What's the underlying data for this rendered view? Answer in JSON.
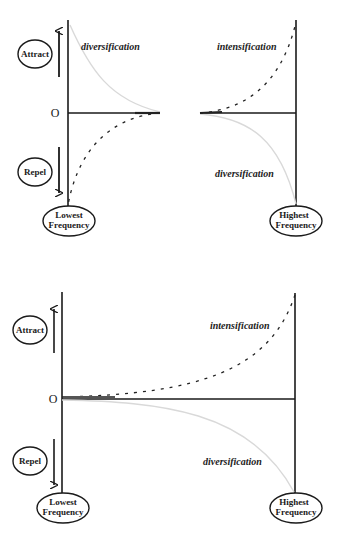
{
  "colors": {
    "axis": "#1a1a1a",
    "curve_light": "#d9d9d9",
    "curve_dark": "#222222",
    "background": "#ffffff"
  },
  "panels": [
    {
      "id": "top",
      "left_badge_top": "Attract",
      "left_badge_bottom": "Repel",
      "origin_label": "O",
      "low_label_line1": "Lowest",
      "low_label_line2": "Frequency",
      "high_label_line1": "Highest",
      "high_label_line2": "Frequency",
      "region_top_left": "diversification",
      "region_top_right": "intensification",
      "region_bottom_right": "diversification"
    },
    {
      "id": "bottom",
      "left_badge_top": "Attract",
      "left_badge_bottom": "Repel",
      "origin_label": "O",
      "low_label_line1": "Lowest",
      "low_label_line2": "Frequency",
      "high_label_line1": "Highest",
      "high_label_line2": "Frequency",
      "region_top_right": "intensification",
      "region_bottom_right": "diversification"
    }
  ]
}
